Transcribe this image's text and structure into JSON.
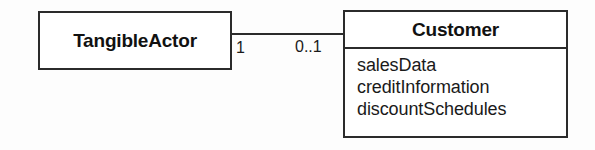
{
  "diagram": {
    "type": "uml-class-diagram",
    "background_color": "#fdfdfd",
    "line_color": "#2b2b2b",
    "text_color": "#1a1a1a",
    "classes": [
      {
        "id": "tangibleactor",
        "name": "TangibleActor",
        "attributes": [],
        "compartments": 1
      },
      {
        "id": "customer",
        "name": "Customer",
        "attributes": [
          "salesData",
          "creditInformation",
          "discountSchedules"
        ],
        "compartments": 2
      }
    ],
    "association": {
      "name": "association-line",
      "source_class": "TangibleActor",
      "target_class": "Customer",
      "source_multiplicity": "1",
      "target_multiplicity": "0..1"
    }
  }
}
